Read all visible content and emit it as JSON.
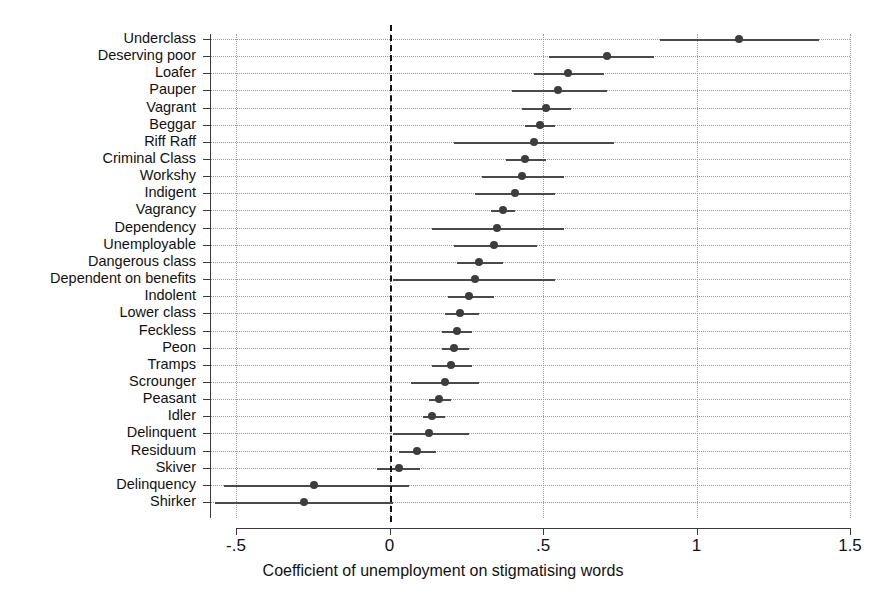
{
  "chart_data": {
    "type": "scatter",
    "title": "",
    "subtitle": "",
    "xlabel": "Coefficient of unemployment on stigmatising words",
    "ylabel": "",
    "xlim": [
      -0.5,
      1.5
    ],
    "xticks": [
      -0.5,
      0,
      0.5,
      1,
      1.5
    ],
    "xtick_labels": [
      "-.5",
      "0",
      ".5",
      "1",
      "1.5"
    ],
    "grid": true,
    "legend": "none",
    "reference_line": 0,
    "orientation": "horizontal",
    "marker": "circle-with-confidence-interval",
    "categories": [
      "Underclass",
      "Deserving poor",
      "Loafer",
      "Pauper",
      "Vagrant",
      "Beggar",
      "Riff Raff",
      "Criminal Class",
      "Workshy",
      "Indigent",
      "Vagrancy",
      "Dependency",
      "Unemployable",
      "Dangerous class",
      "Dependent on benefits",
      "Indolent",
      "Lower class",
      "Feckless",
      "Peon",
      "Tramps",
      "Scrounger",
      "Peasant",
      "Idler",
      "Delinquent",
      "Residuum",
      "Skiver",
      "Delinquency",
      "Shirker"
    ],
    "values": [
      1.14,
      0.71,
      0.58,
      0.55,
      0.51,
      0.49,
      0.47,
      0.44,
      0.43,
      0.41,
      0.37,
      0.35,
      0.34,
      0.29,
      0.28,
      0.26,
      0.23,
      0.22,
      0.21,
      0.2,
      0.18,
      0.16,
      0.14,
      0.13,
      0.09,
      0.03,
      -0.245,
      -0.28
    ],
    "ci_low": [
      0.88,
      0.52,
      0.47,
      0.4,
      0.43,
      0.44,
      0.21,
      0.38,
      0.3,
      0.28,
      0.33,
      0.14,
      0.21,
      0.22,
      0.01,
      0.19,
      0.18,
      0.17,
      0.17,
      0.14,
      0.07,
      0.13,
      0.11,
      0.01,
      0.03,
      -0.04,
      -0.54,
      -0.57
    ],
    "ci_high": [
      1.4,
      0.86,
      0.7,
      0.71,
      0.59,
      0.54,
      0.73,
      0.51,
      0.57,
      0.54,
      0.41,
      0.57,
      0.48,
      0.37,
      0.54,
      0.34,
      0.29,
      0.27,
      0.26,
      0.27,
      0.29,
      0.2,
      0.18,
      0.26,
      0.15,
      0.1,
      0.065,
      0.01
    ]
  },
  "axis": {
    "x_title": "Coefficient of unemployment on stigmatising words"
  },
  "colors": {
    "point": "#3d3d3d",
    "ci": "#4a4a4a",
    "grid": "#9a9a9a",
    "axis": "#3a3a3a",
    "reference": "#111111"
  }
}
